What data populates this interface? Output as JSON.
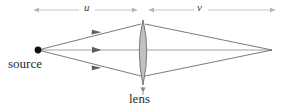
{
  "figure": {
    "width": 283,
    "height": 107,
    "background_color": "#ffffff"
  },
  "labels": {
    "source": "source",
    "lens": "lens",
    "object_distance": "u",
    "image_distance": "v"
  },
  "colors": {
    "ray_line": "#6b6b6b",
    "axis_line": "#9a9a9a",
    "dimension_line": "#b5b5b5",
    "lens_fill": "#b9b9b9",
    "lens_stroke": "#6e6e6e",
    "source_dot": "#111111",
    "text": "#2b2b2b"
  },
  "geometry": {
    "source_point": {
      "x": 38,
      "y": 50
    },
    "image_point": {
      "x": 272,
      "y": 50
    },
    "lens_center": {
      "x": 143,
      "y": 50
    },
    "lens_top": {
      "x": 143,
      "y": 20
    },
    "lens_bottom": {
      "x": 143,
      "y": 85
    },
    "lens_half_width": 7,
    "optical_axis_y": 50,
    "dimension_line_y": 10,
    "dimension_u_start": 33,
    "dimension_u_end": 138,
    "dimension_v_start": 148,
    "dimension_v_end": 276,
    "ray_upper_lens_y": 24,
    "ray_lower_lens_y": 76,
    "arrow_positions": [
      {
        "x": 97,
        "y": 33
      },
      {
        "x": 97,
        "y": 50
      },
      {
        "x": 97,
        "y": 67
      }
    ],
    "lens_pointer": {
      "x": 143,
      "y": 86,
      "tip_y": 86,
      "tail_y": 95
    }
  }
}
